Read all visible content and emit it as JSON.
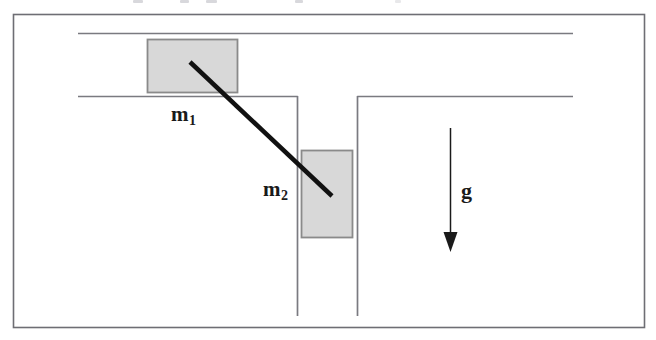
{
  "figure": {
    "type": "physics-free-body-diagram",
    "background_color": "#ffffff",
    "line_color": "#7a7a80",
    "rod_color": "#111111",
    "block_fill_color": "#d8d8d8",
    "block_stroke_color": "#8a8a8a",
    "border": {
      "x": 13,
      "y": 14,
      "width": 632,
      "height": 314,
      "color": "#6e6e74"
    },
    "channels": {
      "horizontal": {
        "top_line_y": 33,
        "bottom_line_y": 96,
        "x_start": 78,
        "x_end": 573
      },
      "vertical": {
        "left_line_x": 297,
        "right_line_x": 358,
        "y_start": 96,
        "y_end": 316
      }
    },
    "blocks": [
      {
        "name": "m1",
        "label": "m",
        "subscript": "1",
        "x": 147,
        "y": 39,
        "width": 91,
        "height": 54,
        "orientation": "horizontal-channel"
      },
      {
        "name": "m2",
        "label": "m",
        "subscript": "2",
        "x": 301,
        "y": 150,
        "width": 52,
        "height": 88,
        "orientation": "vertical-channel"
      }
    ],
    "rod": {
      "name": "connecting-rod",
      "x1": 190,
      "y1": 62,
      "x2": 332,
      "y2": 196,
      "stroke_width": 4.5
    },
    "gravity_arrow": {
      "name": "gravity-arrow",
      "label": "g",
      "direction": "down",
      "shaft_x": 450,
      "shaft_y_start": 128,
      "shaft_y_end": 233,
      "tip_y": 252,
      "head_half_width": 7,
      "stroke_width": 1.4,
      "color": "#1a1a1a"
    },
    "labels": {
      "m1": {
        "text": "m",
        "subscript": "1"
      },
      "m2": {
        "text": "m",
        "subscript": "2"
      },
      "gravity": {
        "text": "g"
      }
    }
  }
}
